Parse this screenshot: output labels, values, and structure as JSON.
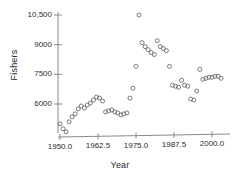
{
  "chart_data": {
    "type": "scatter",
    "title": "",
    "xlabel": "Year",
    "ylabel": "Fishers",
    "xlim": [
      1948.0,
      2005.0
    ],
    "ylim": [
      4400,
      10800
    ],
    "grid": false,
    "legend": null,
    "marker": "open-circle",
    "marker_color": "#6b6b6b",
    "xticks": [
      1950.0,
      1962.5,
      1975.0,
      1987.5,
      2000.0
    ],
    "xtick_labels": [
      "1950.0",
      "1962.5",
      "1975.0",
      "1987.5",
      "2000.0"
    ],
    "yticks": [
      6000,
      7500,
      9000,
      10500
    ],
    "ytick_labels": [
      "6000",
      "7500",
      "9000",
      "10,500"
    ],
    "x": [
      1950,
      1951,
      1952,
      1953,
      1954,
      1955,
      1956,
      1957,
      1958,
      1959,
      1960,
      1961,
      1962,
      1963,
      1964,
      1965,
      1966,
      1967,
      1968,
      1969,
      1970,
      1971,
      1972,
      1973,
      1974,
      1975,
      1976,
      1977,
      1978,
      1979,
      1980,
      1981,
      1982,
      1983,
      1984,
      1985,
      1986,
      1987,
      1988,
      1989,
      1990,
      1991,
      1992,
      1993,
      1994,
      1995,
      1996,
      1997,
      1998,
      1999,
      2000,
      2001,
      2002,
      2003
    ],
    "y": [
      5000,
      4750,
      4600,
      5100,
      5350,
      5500,
      5750,
      5900,
      5800,
      5950,
      6050,
      6200,
      6350,
      6300,
      6150,
      5600,
      5650,
      5700,
      5600,
      5550,
      5450,
      5500,
      5550,
      6300,
      6800,
      7900,
      10500,
      9100,
      8900,
      8750,
      8600,
      8500,
      9200,
      8900,
      8800,
      8700,
      7900,
      6950,
      6900,
      6850,
      7200,
      6950,
      6900,
      6250,
      6200,
      6650,
      7750,
      7250,
      7300,
      7350,
      7350,
      7400,
      7400,
      7300
    ],
    "points": [
      {
        "year": 1950,
        "fishers": 5000
      },
      {
        "year": 1951,
        "fishers": 4750
      },
      {
        "year": 1952,
        "fishers": 4600
      },
      {
        "year": 1953,
        "fishers": 5100
      },
      {
        "year": 1954,
        "fishers": 5350
      },
      {
        "year": 1955,
        "fishers": 5500
      },
      {
        "year": 1956,
        "fishers": 5750
      },
      {
        "year": 1957,
        "fishers": 5900
      },
      {
        "year": 1958,
        "fishers": 5800
      },
      {
        "year": 1959,
        "fishers": 5950
      },
      {
        "year": 1960,
        "fishers": 6050
      },
      {
        "year": 1961,
        "fishers": 6200
      },
      {
        "year": 1962,
        "fishers": 6350
      },
      {
        "year": 1963,
        "fishers": 6300
      },
      {
        "year": 1964,
        "fishers": 6150
      },
      {
        "year": 1965,
        "fishers": 5600
      },
      {
        "year": 1966,
        "fishers": 5650
      },
      {
        "year": 1967,
        "fishers": 5700
      },
      {
        "year": 1968,
        "fishers": 5600
      },
      {
        "year": 1969,
        "fishers": 5550
      },
      {
        "year": 1970,
        "fishers": 5450
      },
      {
        "year": 1971,
        "fishers": 5500
      },
      {
        "year": 1972,
        "fishers": 5550
      },
      {
        "year": 1973,
        "fishers": 6300
      },
      {
        "year": 1974,
        "fishers": 6800
      },
      {
        "year": 1975,
        "fishers": 7900
      },
      {
        "year": 1976,
        "fishers": 10500
      },
      {
        "year": 1977,
        "fishers": 9100
      },
      {
        "year": 1978,
        "fishers": 8900
      },
      {
        "year": 1979,
        "fishers": 8750
      },
      {
        "year": 1980,
        "fishers": 8600
      },
      {
        "year": 1981,
        "fishers": 8500
      },
      {
        "year": 1982,
        "fishers": 9200
      },
      {
        "year": 1983,
        "fishers": 8900
      },
      {
        "year": 1984,
        "fishers": 8800
      },
      {
        "year": 1985,
        "fishers": 8700
      },
      {
        "year": 1986,
        "fishers": 7900
      },
      {
        "year": 1987,
        "fishers": 6950
      },
      {
        "year": 1988,
        "fishers": 6900
      },
      {
        "year": 1989,
        "fishers": 6850
      },
      {
        "year": 1990,
        "fishers": 7200
      },
      {
        "year": 1991,
        "fishers": 6950
      },
      {
        "year": 1992,
        "fishers": 6900
      },
      {
        "year": 1993,
        "fishers": 6250
      },
      {
        "year": 1994,
        "fishers": 6200
      },
      {
        "year": 1995,
        "fishers": 6650
      },
      {
        "year": 1996,
        "fishers": 7750
      },
      {
        "year": 1997,
        "fishers": 7250
      },
      {
        "year": 1998,
        "fishers": 7300
      },
      {
        "year": 1999,
        "fishers": 7350
      },
      {
        "year": 2000,
        "fishers": 7350
      },
      {
        "year": 2001,
        "fishers": 7400
      },
      {
        "year": 2002,
        "fishers": 7400
      },
      {
        "year": 2003,
        "fishers": 7300
      }
    ]
  },
  "style": {
    "axis_color": "#8a8a8a",
    "marker_stroke": "#6b6b6b",
    "text_color": "#2b2b2b",
    "background": "#ffffff"
  }
}
